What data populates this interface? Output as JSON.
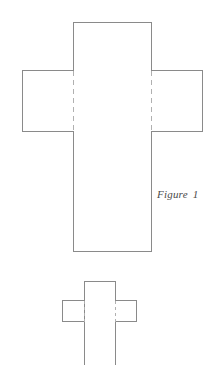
{
  "page": {
    "background_color": "#ffffff",
    "width": 218,
    "height": 365
  },
  "diagram": {
    "title_caption": {
      "word": "Figure",
      "number": "1",
      "full_text": "Figure 1",
      "style": "italic-serif",
      "color": "#4a4a4a"
    },
    "stroke": {
      "solid_color": "#8a8a8a",
      "dashed_color": "#b0b0b0",
      "solid_width": 1,
      "dashed_width": 1,
      "dash_pattern_large": "5 4",
      "dash_pattern_small": "3 3"
    },
    "shapes": [
      {
        "name": "large-cross-net",
        "kind": "cruciform-net",
        "description": "cross-shaped flat net of an open box, larger",
        "vertical_panel": {
          "x1": 73,
          "y1": 22,
          "x2": 151,
          "y2": 252
        },
        "left_flap": {
          "x1": 22,
          "y1": 70,
          "x2": 73,
          "y2": 132
        },
        "right_flap": {
          "x1": 151,
          "y1": 70,
          "x2": 203,
          "y2": 132
        },
        "fold_lines": [
          {
            "x": 73,
            "y1": 70,
            "y2": 132
          },
          {
            "x": 151,
            "y1": 70,
            "y2": 132
          }
        ],
        "closed_bottom": true
      },
      {
        "name": "small-cross-net",
        "kind": "cruciform-net",
        "description": "cross-shaped flat net of an open box, smaller, bottom edge cropped",
        "vertical_panel": {
          "x1": 84,
          "y1": 281,
          "x2": 115,
          "y2": 365
        },
        "left_flap": {
          "x1": 62,
          "y1": 300,
          "x2": 84,
          "y2": 322
        },
        "right_flap": {
          "x1": 115,
          "y1": 300,
          "x2": 137,
          "y2": 322
        },
        "fold_lines": [
          {
            "x": 84,
            "y1": 300,
            "y2": 322
          },
          {
            "x": 115,
            "y1": 300,
            "y2": 322
          }
        ],
        "closed_bottom": false
      }
    ]
  }
}
